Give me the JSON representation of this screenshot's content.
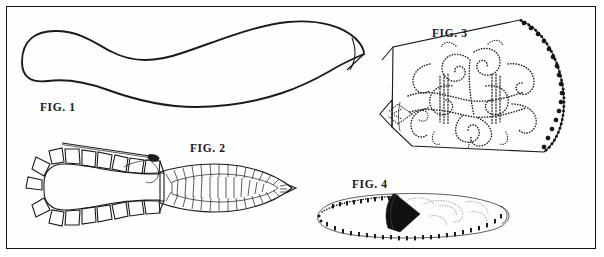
{
  "plate": {
    "title": "Moccasin construction plate",
    "background_color": "#ffffff",
    "border_color": "#111111",
    "ink_color": "#1a1a1a"
  },
  "figures": [
    {
      "id": "fig1",
      "label": "FIG. 1",
      "caption": "FIG. 1",
      "subject": "moccasin sole pattern outline",
      "description": "Single closed curved leather sole blank, rounded heel at left tapering to a point at the right toe"
    },
    {
      "id": "fig2",
      "label": "FIG. 2",
      "caption": "FIG. 2",
      "subject": "sole with gathering stitches and needle",
      "description": "Sole blank with trapezoidal pleat flaps around the heel and a puckered gathered toe; a threaded needle enters at the top"
    },
    {
      "id": "fig3",
      "label": "FIG. 3",
      "caption": "FIG. 3",
      "subject": "beaded vamp panel",
      "description": "Quadrilateral vamp panel covered with dotted beadwork scrolls and curls, dark looped bead trim along the right edge, pointed flap at the left"
    },
    {
      "id": "fig4",
      "label": "FIG. 4",
      "caption": "FIG. 4",
      "subject": "finished beaded moccasin",
      "description": "Completed moccasin in profile with beaded edge trim along the sole seam, dark folded tongue and beaded vamp"
    }
  ]
}
